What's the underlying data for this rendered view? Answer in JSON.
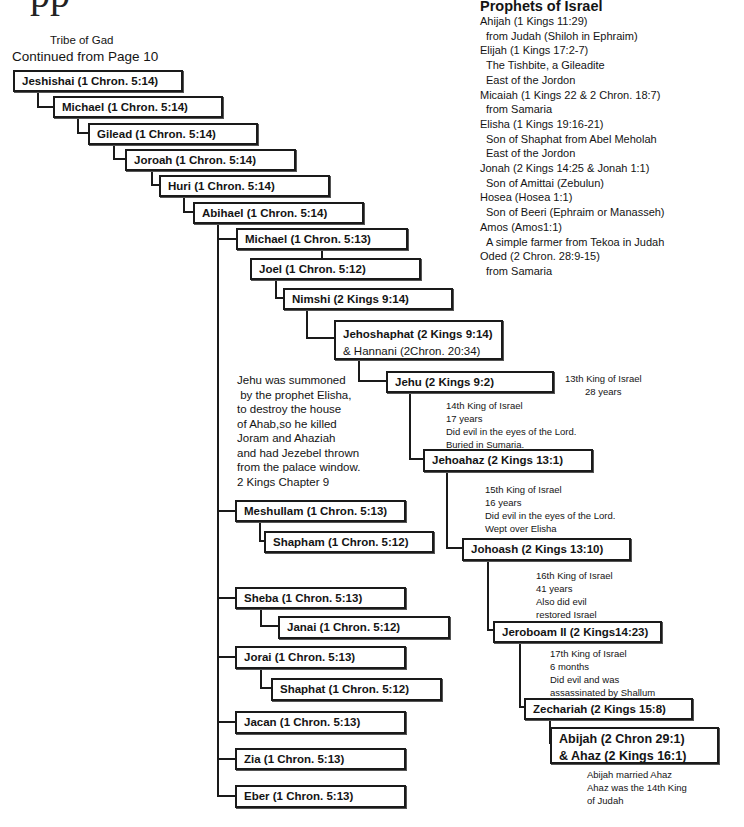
{
  "page_title_fragment": "pp",
  "header": {
    "tribe": "Tribe of Gad",
    "continued": "Continued from Page 10"
  },
  "prophets": {
    "title": "Prophets of Israel",
    "items": [
      {
        "name": "Ahijah (1 Kings 11:29)",
        "lines": [
          "from Judah (Shiloh in Ephraim)"
        ]
      },
      {
        "name": "Elijah (1 Kings 17:2-7)",
        "lines": [
          "The Tishbite, a Gileadite",
          "East of the Jordon"
        ]
      },
      {
        "name": "Micaiah (1 Kings 22 & 2 Chron. 18:7)",
        "lines": [
          "from Samaria"
        ]
      },
      {
        "name": "Elisha (1 Kings 19:16-21)",
        "lines": [
          "Son of Shaphat from Abel Meholah",
          "East of the Jordon"
        ]
      },
      {
        "name": "Jonah (2 Kings 14:25 &  Jonah 1:1)",
        "lines": [
          "Son of Amittai (Zebulun)"
        ]
      },
      {
        "name": "Hosea (Hosea 1:1)",
        "lines": [
          "Son of Beeri (Ephraim or Manasseh)"
        ]
      },
      {
        "name": "Amos (Amos1:1)",
        "lines": [
          "A simple farmer from Tekoa in Judah"
        ]
      },
      {
        "name": "Oded (2 Chron. 28:9-15)",
        "lines": [
          "from Samaria"
        ]
      }
    ]
  },
  "tree": {
    "jeshishai": "Jeshishai (1 Chron. 5:14)",
    "michael1": "Michael (1 Chron. 5:14)",
    "gilead": "Gilead (1 Chron. 5:14)",
    "joroah": "Joroah (1 Chron. 5:14)",
    "huri": "Huri (1 Chron. 5:14)",
    "abihael": "Abihael (1 Chron. 5:14)",
    "michael2": "Michael (1 Chron. 5:13)",
    "joel": "Joel (1 Chron. 5:12)",
    "nimshi": "Nimshi (2 Kings 9:14)",
    "jehoshaphat": {
      "line1": "Jehoshaphat (2 Kings 9:14)",
      "line2": "& Hannani (2Chron. 20:34)"
    },
    "jehu": "Jehu (2 Kings 9:2)",
    "jehoahaz": "Jehoahaz (2 Kings 13:1)",
    "johoash": "Johoash (2 Kings 13:10)",
    "jeroboam": "Jeroboam II (2 Kings14:23)",
    "zechariah": "Zechariah (2 Kings 15:8)",
    "abijah": {
      "line1": "Abijah (2 Chron 29:1)",
      "line2": "& Ahaz (2 Kings 16:1)"
    },
    "meshullam": "Meshullam (1 Chron. 5:13)",
    "shapham": "Shapham (1 Chron. 5:12)",
    "sheba": "Sheba (1 Chron. 5:13)",
    "janai": "Janai (1 Chron. 5:12)",
    "jorai": "Jorai (1 Chron. 5:13)",
    "shaphat": "Shaphat (1 Chron. 5:12)",
    "jacan": "Jacan (1 Chron. 5:13)",
    "zia": "Zia (1 Chron. 5:13)",
    "eber": "Eber (1 Chron. 5:13)"
  },
  "notes": {
    "jehu_story": [
      "Jehu was summoned",
      " by the prophet Elisha,",
      "to destroy the house",
      "of Ahab,so he killed",
      "Joram and Ahaziah",
      "and had Jezebel thrown",
      "from the palace window.",
      "2 Kings Chapter 9"
    ],
    "king13": [
      "13th King of Israel",
      "28 years"
    ],
    "king14": [
      "14th King of Israel",
      "17 years",
      "Did evil in the eyes of the Lord.",
      "Buried in Sumaria."
    ],
    "king15": [
      "15th King of Israel",
      "16 years",
      "Did evil in the eyes of the Lord.",
      "Wept over Elisha"
    ],
    "king16": [
      "16th King of Israel",
      "41 years",
      "Also did evil",
      "restored Israel"
    ],
    "king17": [
      "17th King of Israel",
      "6 months",
      "Did evil and was",
      "assassinated by Shallum"
    ],
    "abijah_note": [
      "Abijah married Ahaz",
      "Ahaz was the 14th King",
      "of Judah"
    ]
  }
}
